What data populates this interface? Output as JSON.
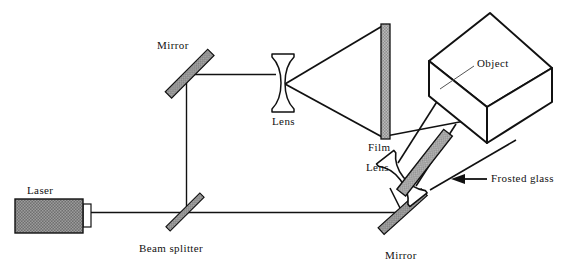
{
  "figure": {
    "width": 565,
    "height": 274,
    "background": "#ffffff"
  },
  "colors": {
    "stroke": "#111111",
    "laser_fill": "#7a7a7a",
    "mirror_fill": "#8a8a8a",
    "film_fill": "#9a9a9a",
    "glass_fill": "#8a8a8a",
    "beam": "#111111",
    "white": "#ffffff"
  },
  "labels": {
    "laser": "Laser",
    "mirror_top": "Mirror",
    "lens_top": "Lens",
    "film": "Film",
    "lens_bottom": "Lens",
    "object": "Object",
    "frosted_glass": "Frosted glass",
    "beam_splitter": "Beam splitter",
    "mirror_bottom": "Mirror"
  },
  "components": [
    {
      "name": "laser",
      "label": "Laser",
      "type": "source",
      "x": 15,
      "y": 199,
      "width": 68,
      "height": 34
    },
    {
      "name": "laser-aperture",
      "label": "",
      "type": "aperture",
      "x": 83,
      "y": 204,
      "width": 8,
      "height": 23
    },
    {
      "name": "beam-splitter",
      "label": "Beam splitter",
      "type": "beam-splitter",
      "cx": 185,
      "cy": 212,
      "angle": -45
    },
    {
      "name": "mirror-top-left",
      "label": "Mirror",
      "type": "mirror",
      "cx": 190,
      "cy": 74,
      "angle": -45
    },
    {
      "name": "mirror-bottom-right",
      "label": "Mirror",
      "type": "mirror",
      "cx": 403,
      "cy": 212,
      "angle": -45
    },
    {
      "name": "lens-top",
      "label": "Lens",
      "type": "biconcave-lens",
      "cx": 283,
      "cy": 83
    },
    {
      "name": "film",
      "label": "Film",
      "type": "film-plate",
      "x": 381,
      "y": 24,
      "width": 9,
      "height": 115
    },
    {
      "name": "lens-bottom",
      "label": "Lens",
      "type": "biconcave-lens",
      "cx": 405,
      "cy": 176,
      "angle": -40
    },
    {
      "name": "frosted-glass",
      "label": "Frosted glass",
      "type": "diffuser-plate",
      "cx": 425,
      "cy": 163,
      "angle": -52
    },
    {
      "name": "object-cube",
      "label": "Object",
      "type": "cube",
      "top": 13,
      "bottom": 143,
      "left": 429,
      "right": 552
    }
  ],
  "beam_paths": [
    {
      "name": "laser-to-splitter",
      "from": "laser-aperture",
      "to": "beam-splitter"
    },
    {
      "name": "splitter-up-to-mirror",
      "from": "beam-splitter",
      "to": "mirror-top-left"
    },
    {
      "name": "mirror-to-lens-top",
      "from": "mirror-top-left",
      "to": "lens-top"
    },
    {
      "name": "lens-cone-to-film",
      "from": "lens-top",
      "to": "film"
    },
    {
      "name": "splitter-to-mirror-bottom",
      "from": "beam-splitter",
      "to": "mirror-bottom-right"
    },
    {
      "name": "mirror-bottom-to-lens-bottom",
      "from": "mirror-bottom-right",
      "to": "lens-bottom"
    },
    {
      "name": "lens-bottom-through-glass-to-object",
      "from": "lens-bottom",
      "to": "object-cube"
    },
    {
      "name": "object-to-film",
      "from": "object-cube",
      "to": "film"
    }
  ],
  "annotations": [
    {
      "name": "frosted-glass-callout",
      "label": "Frosted glass",
      "arrow": "left"
    },
    {
      "name": "object-leader-line",
      "label": "Object",
      "arrow": "none"
    }
  ]
}
